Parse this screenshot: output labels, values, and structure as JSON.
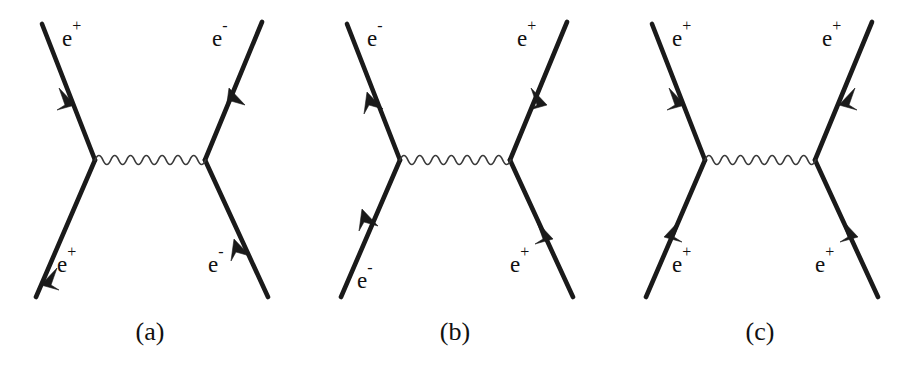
{
  "figure": {
    "type": "feynman-diagrams",
    "background_color": "#ffffff",
    "line_color": "#1a1a1a",
    "photon_color": "#3a3a3a",
    "width": 914,
    "height": 376,
    "panels": [
      {
        "id": "a",
        "caption": "(a)",
        "process": "Bhabha scattering (t-channel)",
        "photon": {
          "periods": 7,
          "amplitude": 9
        },
        "legs": [
          {
            "position": "top-left",
            "label_text": "e",
            "label_sup": "+",
            "arrow_direction": "down-right",
            "arrow_into_vertex": true
          },
          {
            "position": "bottom-left",
            "label_text": "e",
            "label_sup": "+",
            "arrow_direction": "down-left",
            "arrow_into_vertex": false
          },
          {
            "position": "top-right",
            "label_text": "e",
            "label_sup": "-",
            "arrow_direction": "up-right",
            "arrow_into_vertex": false
          },
          {
            "position": "bottom-right",
            "label_text": "e",
            "label_sup": "-",
            "arrow_direction": "up-left",
            "arrow_into_vertex": true
          }
        ]
      },
      {
        "id": "b",
        "caption": "(b)",
        "process": "electron-positron t-channel exchange",
        "photon": {
          "periods": 7,
          "amplitude": 9
        },
        "legs": [
          {
            "position": "top-left",
            "label_text": "e",
            "label_sup": "-",
            "arrow_direction": "up-left",
            "arrow_into_vertex": false
          },
          {
            "position": "bottom-left",
            "label_text": "e",
            "label_sup": "-",
            "arrow_direction": "up-right",
            "arrow_into_vertex": true
          },
          {
            "position": "top-right",
            "label_text": "e",
            "label_sup": "+",
            "arrow_direction": "down-left",
            "arrow_into_vertex": true
          },
          {
            "position": "bottom-right",
            "label_text": "e",
            "label_sup": "+",
            "arrow_direction": "down-right",
            "arrow_into_vertex": false
          }
        ]
      },
      {
        "id": "c",
        "caption": "(c)",
        "process": "positron-positron (Moller-like) scattering",
        "photon": {
          "periods": 7,
          "amplitude": 9
        },
        "legs": [
          {
            "position": "top-left",
            "label_text": "e",
            "label_sup": "+",
            "arrow_direction": "down-right",
            "arrow_into_vertex": true
          },
          {
            "position": "bottom-left",
            "label_text": "e",
            "label_sup": "+",
            "arrow_direction": "down-left",
            "arrow_into_vertex": false
          },
          {
            "position": "top-right",
            "label_text": "e",
            "label_sup": "+",
            "arrow_direction": "down-left",
            "arrow_into_vertex": true
          },
          {
            "position": "bottom-right",
            "label_text": "e",
            "label_sup": "+",
            "arrow_direction": "down-right",
            "arrow_into_vertex": false
          }
        ]
      }
    ]
  }
}
